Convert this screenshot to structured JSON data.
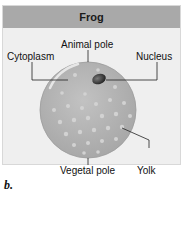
{
  "diagram": {
    "title": "Frog",
    "subfigure_label": "b.",
    "labels": {
      "animal_pole": "Animal pole",
      "cytoplasm": "Cytoplasm",
      "nucleus": "Nucleus",
      "vegetal_pole": "Vegetal pole",
      "yolk": "Yolk"
    },
    "colors": {
      "header_bg": "#a9a9a9",
      "panel_bg": "#efefef",
      "egg_fill": "#b5b5b5",
      "yolk_dots": "#d0d0d0",
      "nucleus": "#3a3a3a"
    }
  }
}
